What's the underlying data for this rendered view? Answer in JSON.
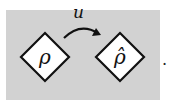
{
  "diagram": {
    "background_color": "#d2d2d2",
    "nodes": [
      {
        "id": "source",
        "label": "ρ",
        "shape": "diamond"
      },
      {
        "id": "target",
        "label": "ρ̂",
        "shape": "diamond"
      }
    ],
    "edges": [
      {
        "from": "source",
        "to": "target",
        "label": "u",
        "style": "curved-arrow"
      }
    ],
    "trailing_punctuation": "."
  }
}
